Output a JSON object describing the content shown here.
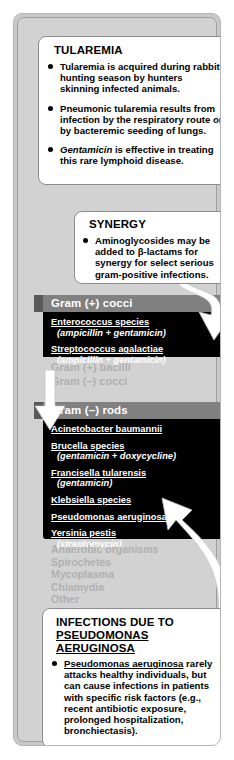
{
  "card": {
    "accent_header_color": "#808080",
    "panel_color": "#000000",
    "background_color": "#d2d2d2",
    "disabled_text_color": "#b0b0b0"
  },
  "tularemia_box": {
    "title": "TULAREMIA",
    "bullets": [
      {
        "segments": [
          {
            "text": "Tularemia is acquired during rabbit-hunting season by hunters skinning infected animals.",
            "style": "normal"
          }
        ]
      },
      {
        "segments": [
          {
            "text": "Pneumonic tularemia results from infection by the respiratory route or by bacteremic seeding of lungs.",
            "style": "normal"
          }
        ]
      },
      {
        "segments": [
          {
            "text": "Gentamicin",
            "style": "italic"
          },
          {
            "text": " is effective in treating this rare lymphoid disease.",
            "style": "normal"
          }
        ]
      }
    ]
  },
  "synergy_box": {
    "title": "SYNERGY",
    "bullets": [
      {
        "segments": [
          {
            "text": "Aminoglycosides may be added to β-lactams for synergy for select serious gram-positive infections.",
            "style": "normal"
          }
        ]
      }
    ]
  },
  "sections": [
    {
      "header": "Gram (+) cocci",
      "enabled": true,
      "organisms": [
        {
          "name": "Enterococcus species",
          "drug": "(ampicillin + gentamicin)"
        },
        {
          "name": "Streptococcus agalactiae",
          "drug": "(ampicillin + gentamicin)"
        }
      ]
    },
    {
      "header": "Gram (+) bacilli",
      "enabled": false,
      "organisms": []
    },
    {
      "header": "Gram (–) cocci",
      "enabled": false,
      "organisms": []
    },
    {
      "header": "Gram (–) rods",
      "enabled": true,
      "organisms": [
        {
          "name": "Acinetobacter baumannii",
          "drug": ""
        },
        {
          "name": "Brucella species",
          "drug": "(gentamicin + doxycycline)"
        },
        {
          "name": "Francisella tularensis",
          "drug": "(gentamicin)"
        },
        {
          "name": "Klebsiella species",
          "drug": ""
        },
        {
          "name": "Pseudomonas aeruginosa",
          "drug": ""
        },
        {
          "name": "Yersinia pestis",
          "drug": "(streptomycin)"
        }
      ]
    }
  ],
  "disabled_categories": [
    "Anaerobic organisms",
    "Spirochetes",
    "Mycoplasma",
    "Chlamydia",
    "Other"
  ],
  "pseudomonas_box": {
    "title_line1": "INFECTIONS DUE TO",
    "title_line2": "PSEUDOMONAS AERUGINOSA",
    "bullets": [
      {
        "segments": [
          {
            "text": "Pseudomonas aeruginosa",
            "style": "underline"
          },
          {
            "text": " rarely attacks healthy individuals, but can cause infections in patients with specific risk factors (e.g., recent antibiotic exposure, prolonged hospitalization, bronchiectasis).",
            "style": "normal"
          }
        ]
      },
      {
        "segments": [
          {
            "text": "Treatment includes ",
            "style": "normal"
          },
          {
            "text": "tobramycin",
            "style": "italic"
          },
          {
            "text": " alone (e.g., for UTI) or in combination with an antipseudomonal β-lactam (e.g., for pneumonia).",
            "style": "normal"
          }
        ]
      }
    ]
  },
  "arrows": [
    {
      "name": "synergy-to-gram-positive-cocci",
      "direction": "down"
    },
    {
      "name": "gram-negative-rods-pointer",
      "direction": "down"
    },
    {
      "name": "pseudomonas-box-to-organism",
      "direction": "up"
    }
  ]
}
